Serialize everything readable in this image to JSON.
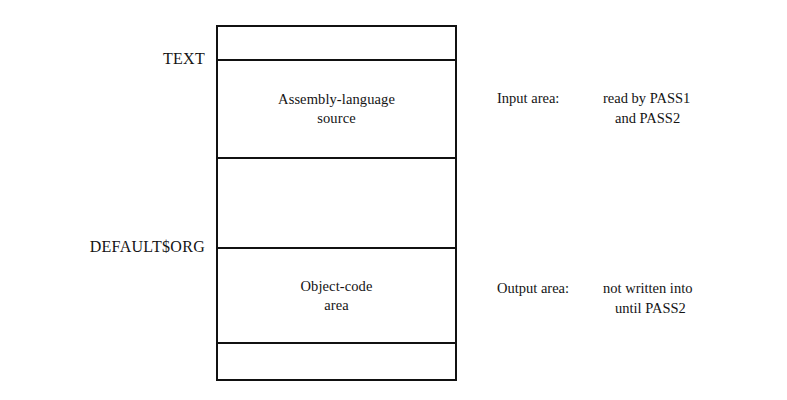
{
  "diagram": {
    "line_color": "#111111",
    "background_color": "#ffffff",
    "address_labels": [
      {
        "name": "text-label",
        "text": "TEXT"
      },
      {
        "name": "default-org-label",
        "text": "DEFAULT$ORG"
      }
    ],
    "bands": [
      {
        "name": "top-reserved-band",
        "text": ""
      },
      {
        "name": "assembly-source-band",
        "line1": "Assembly-language",
        "line2": "source"
      },
      {
        "name": "unused-gap-band",
        "text": ""
      },
      {
        "name": "object-code-band",
        "line1": "Object-code",
        "line2": "area"
      },
      {
        "name": "bottom-reserved-band",
        "text": ""
      }
    ],
    "annotations": [
      {
        "name": "input-area-annotation",
        "label": "Input area:",
        "line1": "read by PASS1",
        "line2": "and PASS2"
      },
      {
        "name": "output-area-annotation",
        "label": "Output area:",
        "line1": "not written into",
        "line2": "until PASS2"
      }
    ]
  }
}
